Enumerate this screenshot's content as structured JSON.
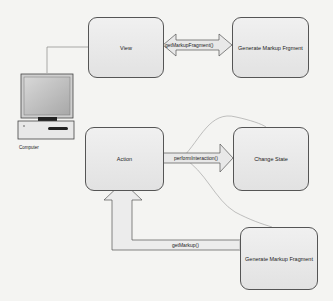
{
  "diagram": {
    "nodes": {
      "view": "View",
      "generate_top": "Generate Markup Frgment",
      "action": "Action",
      "change_state": "Change State",
      "generate_bottom": "Generate Markup Fragment",
      "computer": "Computer"
    },
    "edges": {
      "get_markup_fragment": "getMarkupFragment()",
      "perform_interaction": "performInteraction()",
      "get_markup": "getMarkup()"
    },
    "colors": {
      "box_fill": "#e6e6e6",
      "box_border": "#555555",
      "arrow_fill": "#e8e8e8",
      "background": "#f4f4f2"
    }
  }
}
